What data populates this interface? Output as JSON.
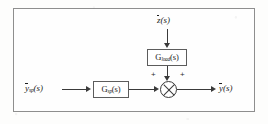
{
  "figure": {
    "type": "control-system-block-diagram"
  },
  "signals": {
    "setpoint_input": "ȳsp(s)",
    "disturbance_input": "z̄(s)",
    "output": "ȳ(s)"
  },
  "blocks": [
    {
      "id": "setpoint-block",
      "label": "Gsp(s)"
    },
    {
      "id": "load-block",
      "label": "Gload(s)"
    }
  ],
  "summing_junction": {
    "name": "summing-junction",
    "glyph": "circle-with-x",
    "left_sign": "+",
    "right_sign": "+"
  },
  "label_parts": {
    "setpoint_input": {
      "bar_var": "y",
      "sub": "sp",
      "arg": "(s)"
    },
    "disturbance_input": {
      "bar_var": "z",
      "sub": "",
      "arg": "(s)"
    },
    "output": {
      "bar_var": "y",
      "sub": "",
      "arg": "(s)"
    },
    "setpoint_block": {
      "var": "G",
      "sub": "sp",
      "arg": "(s)"
    },
    "load_block": {
      "var": "G",
      "sub": "load",
      "arg": "(s)"
    }
  },
  "colors": {
    "line": "#3a3a3a",
    "frame": "#8e8e8e",
    "background": "#fdfdfc",
    "text": "#1c1c1c"
  }
}
